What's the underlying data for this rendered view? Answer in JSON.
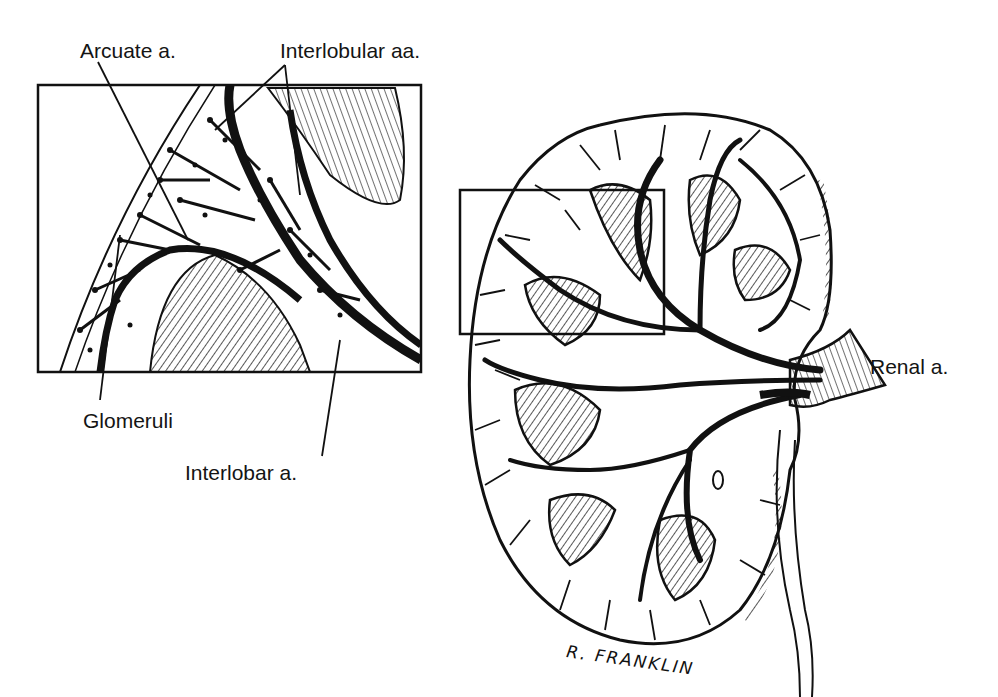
{
  "figure": {
    "labels": {
      "arcuate": "Arcuate a.",
      "interlobular": "Interlobular aa.",
      "glomeruli": "Glomeruli",
      "interlobar": "Interlobar a.",
      "renal": "Renal a."
    },
    "signature": "R. FRANKLIN",
    "colors": {
      "ink": "#111111",
      "background": "#ffffff"
    }
  }
}
